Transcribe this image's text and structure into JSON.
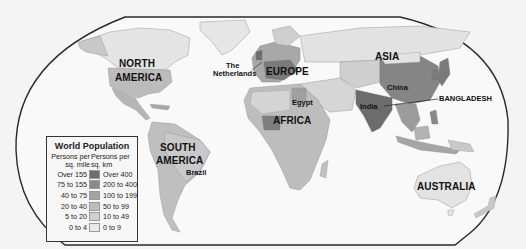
{
  "map": {
    "title": "World Population",
    "frame_color": "#2a2a2a",
    "ocean_color": "#f8f8f8",
    "labels": {
      "north_america": [
        "NORTH",
        "AMERICA"
      ],
      "south_america": [
        "SOUTH",
        "AMERICA"
      ],
      "europe": "EUROPE",
      "africa": "AFRICA",
      "asia": "ASIA",
      "australia": "AUSTRALIA",
      "netherlands": [
        "The",
        "Netherlands"
      ],
      "egypt": "Egypt",
      "china": "China",
      "india": "India",
      "brazil": "Brazil",
      "bangladesh": "BANGLADESH"
    }
  },
  "legend": {
    "title": "World Population",
    "header_mile": "Persons per sq. mile",
    "header_km": "Persons per sq. km",
    "rows": [
      {
        "mile": "Over 155",
        "km": "Over 400",
        "color": "#6e6e6e"
      },
      {
        "mile": "75 to 155",
        "km": "200 to 400",
        "color": "#8a8a8a"
      },
      {
        "mile": "40 to 75",
        "km": "100 to 199",
        "color": "#a3a3a3"
      },
      {
        "mile": "20 to 40",
        "km": "50 to 99",
        "color": "#bdbdbd"
      },
      {
        "mile": "5 to 20",
        "km": "10 to 49",
        "color": "#d0d0d0"
      },
      {
        "mile": "0 to 4",
        "km": "0 to 9",
        "color": "#e8e8e8"
      }
    ]
  }
}
